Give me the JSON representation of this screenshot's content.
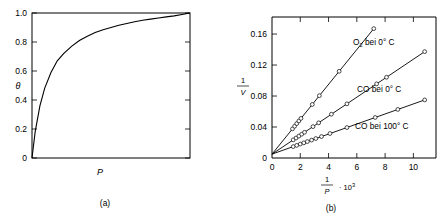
{
  "figure": {
    "panel_a_caption": "(a)",
    "panel_b_caption": "(b)"
  },
  "chart_data": [
    {
      "type": "line",
      "panel": "a",
      "title": "",
      "xlabel": "P",
      "ylabel": "θ",
      "xlim": [
        0,
        1
      ],
      "ylim": [
        0,
        1.0
      ],
      "xticks": [],
      "xticklabels": [],
      "yticks": [
        0,
        0.2,
        0.4,
        0.6,
        0.8,
        1.0
      ],
      "yticklabels": [
        "0",
        "0.2",
        "0.4",
        "0.6",
        "0.8",
        "1.0"
      ],
      "grid": false,
      "legend": "none",
      "series": [
        {
          "name": "Langmuir isotherm",
          "equation": "theta = bP/(1+bP)",
          "x": [
            0.0,
            0.02,
            0.05,
            0.08,
            0.12,
            0.16,
            0.2,
            0.25,
            0.3,
            0.35,
            0.4,
            0.45,
            0.5,
            0.55,
            0.6,
            0.65,
            0.7,
            0.75,
            0.8,
            0.85,
            0.9,
            0.95,
            1.0
          ],
          "y": [
            0.0,
            0.18,
            0.36,
            0.48,
            0.59,
            0.67,
            0.72,
            0.77,
            0.81,
            0.84,
            0.865,
            0.885,
            0.9,
            0.915,
            0.928,
            0.94,
            0.95,
            0.958,
            0.966,
            0.973,
            0.98,
            0.99,
            1.0
          ]
        }
      ]
    },
    {
      "type": "scatter",
      "panel": "b",
      "title": "",
      "xlabel_num": "1",
      "xlabel_den": "P",
      "xlabel_factor": "· 10",
      "xlabel_exp": "3",
      "ylabel_num": "1",
      "ylabel_den": "V",
      "xlim": [
        0,
        11.6
      ],
      "ylim": [
        0,
        0.182
      ],
      "xticks": [
        0,
        2,
        4,
        6,
        8,
        10
      ],
      "xticklabels": [
        "0",
        "2",
        "4",
        "6",
        "8",
        "10"
      ],
      "yticks": [
        0,
        0.04,
        0.08,
        0.12,
        0.16
      ],
      "yticklabels": [
        "0",
        "0.04",
        "0.08",
        "0.12",
        "0.16"
      ],
      "grid": false,
      "legend": "inline-annotations",
      "series": [
        {
          "name": "O2 bei 0° C",
          "label": "O",
          "label_sub": "2",
          "label_rest": " bei 0° C",
          "intercept": 0.005,
          "slope": 0.0225,
          "x": [
            1.45,
            1.6,
            1.75,
            1.9,
            2.05,
            2.85,
            3.35,
            4.75,
            7.2
          ],
          "y": [
            0.0376,
            0.041,
            0.0444,
            0.0478,
            0.0511,
            0.0691,
            0.0804,
            0.1119,
            0.167
          ]
        },
        {
          "name": "CO bei 0° C",
          "label": "CO bei 0° C",
          "intercept": 0.005,
          "slope": 0.01225,
          "x": [
            1.5,
            1.7,
            1.9,
            2.1,
            2.3,
            2.9,
            3.3,
            4.2,
            5.3,
            7.4,
            8.1,
            10.8
          ],
          "y": [
            0.0234,
            0.0258,
            0.0283,
            0.0307,
            0.0332,
            0.0405,
            0.0454,
            0.0565,
            0.0699,
            0.0957,
            0.1042,
            0.1373
          ]
        },
        {
          "name": "CO bei 100° C",
          "label": "CO bei 100° C",
          "intercept": 0.005,
          "slope": 0.00648,
          "x": [
            1.5,
            1.75,
            2.0,
            2.25,
            2.5,
            2.8,
            3.1,
            3.5,
            4.1,
            5.3,
            7.3,
            8.9,
            10.8
          ],
          "y": [
            0.0147,
            0.0163,
            0.018,
            0.0196,
            0.0212,
            0.0231,
            0.0251,
            0.0277,
            0.0316,
            0.0393,
            0.0523,
            0.0627,
            0.075
          ]
        }
      ]
    }
  ]
}
